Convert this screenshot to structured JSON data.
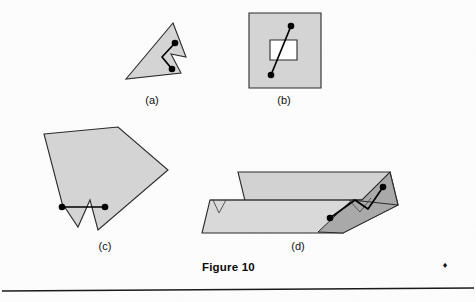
{
  "page": {
    "background_color": "#fdfdfd",
    "width": 476,
    "height": 302
  },
  "figure": {
    "caption": "Figure 10",
    "caption_x": 202,
    "caption_y": 271,
    "colors": {
      "polygon_fill": "#d4d4d4",
      "polygon_fill_dark": "#a9a9a9",
      "polygon_stroke": "#2a2a2a",
      "segment_stroke": "#000000",
      "hole_fill": "#ffffff",
      "text": "#111111",
      "rule": "#1a1a1a"
    }
  },
  "panels": [
    {
      "id": "a",
      "label": "(a)",
      "label_x": 152,
      "label_y": 104,
      "description": "Simple non-convex polygon with a notch; two marked points whose connecting segment exits the polygon",
      "shape_points": "173,23 186,57 171,54 181,73 126,79",
      "hole_points": "",
      "segment_path": "M 175,43 L 162,57 L 172,69",
      "dots": [
        {
          "cx": 175,
          "cy": 43,
          "r": 3.3
        },
        {
          "cx": 172,
          "cy": 69,
          "r": 3.3
        }
      ]
    },
    {
      "id": "b",
      "label": "(b)",
      "label_x": 284,
      "label_y": 104,
      "description": "Square region with a square hole; segment between two marked points passes through the hole",
      "shape_points": "249,13 321,13 321,88 249,88",
      "hole_points": "270,40 297,40 297,60 270,60",
      "segment_path": "M 291,26 L 271,75",
      "dots": [
        {
          "cx": 291,
          "cy": 26,
          "r": 3.3
        },
        {
          "cx": 271,
          "cy": 75,
          "r": 3.3
        }
      ]
    },
    {
      "id": "c",
      "label": "(c)",
      "label_x": 105,
      "label_y": 250,
      "description": "Large non-convex polygon with a V notch at the bottom; segment between two marked points crosses outside the polygon",
      "shape_points": "44,134 118,127 168,170 98,230 90,200 78,227 62,203",
      "hole_points": "",
      "segment_path": "M 62,207 L 105,207",
      "dots": [
        {
          "cx": 62,
          "cy": 207,
          "r": 3.3
        },
        {
          "cx": 105,
          "cy": 207,
          "r": 3.3
        }
      ]
    },
    {
      "id": "d",
      "label": "(d)",
      "label_x": 298,
      "label_y": 250,
      "description": "Three dimensional prism formed by two parallelogram faces with notches; segment between two marked points leaves the solid",
      "shape_points": "238,172 390,172 398,205 343,233 202,233",
      "hole_points": "",
      "segment_path": "M 330,218 L 355,200 L 368,209 L 383,187",
      "dots": [
        {
          "cx": 330,
          "cy": 218,
          "r": 3.3
        },
        {
          "cx": 383,
          "cy": 187,
          "r": 3.3
        }
      ]
    }
  ],
  "page_marks": {
    "corner_mark": "♦",
    "corner_mark_x": 445,
    "corner_mark_y": 268,
    "rule_x1": 2,
    "rule_y1": 291,
    "rule_x2": 474,
    "rule_y2": 288
  }
}
